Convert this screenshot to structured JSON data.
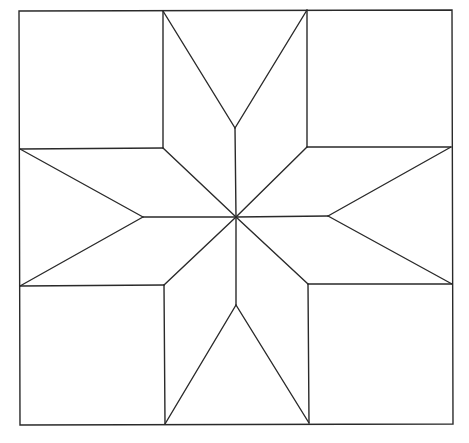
{
  "diagram": {
    "title": "",
    "stroke_color": "#2a2a2a",
    "background_color": "#ffffff",
    "outer_square": {
      "tl": [
        19,
        11
      ],
      "tr": [
        452,
        10
      ],
      "br": [
        453,
        424
      ],
      "bl": [
        20,
        425
      ]
    },
    "center": [
      236,
      217
    ],
    "corner_squares": [
      {
        "name": "top-left",
        "inner_corner": [
          163,
          148
        ]
      },
      {
        "name": "top-right",
        "inner_corner": [
          307,
          147
        ]
      },
      {
        "name": "bottom-left",
        "inner_corner": [
          164,
          285
        ]
      },
      {
        "name": "bottom-right",
        "inner_corner": [
          308,
          284
        ]
      }
    ],
    "star_inner_points": {
      "top": [
        235,
        128
      ],
      "bottom": [
        236,
        305
      ],
      "left": [
        143,
        217
      ],
      "right": [
        328,
        216
      ]
    },
    "edge_points": {
      "top_left": [
        163,
        11
      ],
      "top_right": [
        307,
        10
      ],
      "bottom_left": [
        165,
        424
      ],
      "bottom_right": [
        309,
        423
      ],
      "left_top": [
        20,
        149
      ],
      "left_bottom": [
        20,
        286
      ],
      "right_top": [
        451,
        147
      ],
      "right_bottom": [
        452,
        284
      ]
    }
  }
}
